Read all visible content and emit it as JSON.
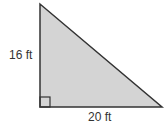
{
  "figure": {
    "shape": "right-triangle",
    "fill_color": "#d4d4d4",
    "stroke_color": "#333333",
    "height_label": "16 ft",
    "base_label": "20 ft",
    "right_angle_marker": true
  }
}
